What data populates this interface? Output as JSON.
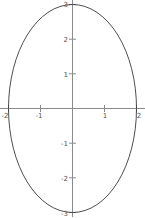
{
  "chart_data": {
    "type": "line",
    "title": "",
    "subtitle": "",
    "xlabel": "",
    "ylabel": "",
    "curve": {
      "name": "ellipse",
      "equation": "x^2/4 + y^2/9 = 1",
      "semi_axis_x": 2,
      "semi_axis_y": 3,
      "center_x": 0,
      "center_y": 0,
      "stroke_color": "#3a3a3a",
      "stroke_width": 0.9,
      "fill": "none"
    },
    "x_intercepts": [
      -2,
      2
    ],
    "y_intercepts": [
      -3,
      3
    ],
    "xlim": [
      -2.2,
      2.2
    ],
    "ylim": [
      -3.2,
      3.2
    ],
    "grid": false,
    "legend": "none",
    "axis_color": "#8a8a8a",
    "background_color": "#ffffff",
    "xaxis": {
      "tick_values": [
        -2,
        -1,
        1,
        2
      ],
      "tick_labels": [
        "-2",
        "-1",
        "1",
        "2"
      ]
    },
    "yaxis": {
      "tick_values": [
        -3,
        -2,
        -1,
        1,
        2,
        3
      ],
      "tick_labels": [
        "-3",
        "-2",
        "-1",
        "1",
        "2",
        "3"
      ]
    }
  },
  "axis_labels": {
    "x": {
      "neg2": "-2",
      "neg1": "-1",
      "pos1": "1",
      "pos2": "2"
    },
    "y": {
      "neg3": "-3",
      "neg2": "-2",
      "neg1": "-1",
      "pos1": "1",
      "pos2": "2",
      "pos3": "3"
    }
  }
}
